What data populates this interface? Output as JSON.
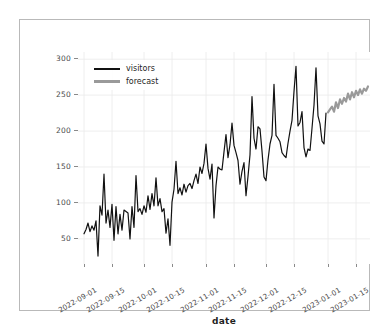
{
  "figure": {
    "background_color": "#ffffff",
    "frame_color": "#b9b9b9"
  },
  "legend": {
    "position": "upper-left",
    "entries": [
      {
        "label": "visitors",
        "color": "#111111"
      },
      {
        "label": "forecast",
        "color": "#9a9a9a"
      }
    ]
  },
  "chart_data": {
    "type": "line",
    "title": "",
    "xlabel": "date",
    "ylabel": "",
    "grid": true,
    "legend_position": "upper left",
    "ylim": [
      15,
      310
    ],
    "yticks": [
      50,
      100,
      150,
      200,
      250,
      300
    ],
    "ytick_labels": [
      "50",
      "100",
      "150",
      "200",
      "250",
      "300"
    ],
    "xticks": [
      "2022-09-01",
      "2022-09-15",
      "2022-10-01",
      "2022-10-15",
      "2022-11-01",
      "2022-11-15",
      "2022-12-01",
      "2022-12-15",
      "2023-01-01",
      "2023-01-15"
    ],
    "xtick_labels": [
      "2022-09-01",
      "2022-09-15",
      "2022-10-01",
      "2022-10-15",
      "2022-11-01",
      "2022-11-15",
      "2022-12-01",
      "2022-12-15",
      "2023-01-01",
      "2023-01-15"
    ],
    "xlim": [
      "2022-08-29",
      "2023-01-22"
    ],
    "series": [
      {
        "name": "visitors",
        "color": "#111111",
        "linewidth": 1.2,
        "x_start": "2022-09-01",
        "x_end": "2022-12-31",
        "values": [
          57,
          63,
          72,
          60,
          68,
          62,
          75,
          26,
          96,
          83,
          140,
          72,
          90,
          66,
          98,
          48,
          95,
          57,
          84,
          62,
          90,
          88,
          86,
          50,
          95,
          66,
          138,
          88,
          92,
          84,
          96,
          87,
          110,
          91,
          113,
          96,
          135,
          96,
          106,
          88,
          92,
          58,
          78,
          41,
          101,
          119,
          158,
          113,
          121,
          111,
          126,
          115,
          124,
          127,
          120,
          131,
          140,
          127,
          150,
          141,
          155,
          182,
          148,
          133,
          154,
          79,
          124,
          150,
          147,
          146,
          171,
          195,
          163,
          181,
          211,
          180,
          170,
          159,
          126,
          144,
          156,
          110,
          137,
          167,
          248,
          190,
          175,
          206,
          203,
          172,
          136,
          131,
          160,
          182,
          194,
          265,
          194,
          190,
          185,
          170,
          166,
          163,
          183,
          200,
          215,
          255,
          290,
          207,
          212,
          227,
          177,
          164,
          175,
          173,
          204,
          236,
          288,
          221,
          210,
          186,
          182,
          225
        ]
      },
      {
        "name": "forecast",
        "color": "#9a9a9a",
        "linewidth": 2.2,
        "x_start": "2023-01-01",
        "x_end": "2023-01-21",
        "values": [
          226,
          230,
          234,
          227,
          240,
          232,
          244,
          238,
          246,
          241,
          252,
          244,
          254,
          247,
          256,
          250,
          258,
          252,
          259,
          256,
          262
        ]
      }
    ]
  },
  "axes": {
    "x_tick_marks": 10,
    "y_tick_marks": 6
  }
}
